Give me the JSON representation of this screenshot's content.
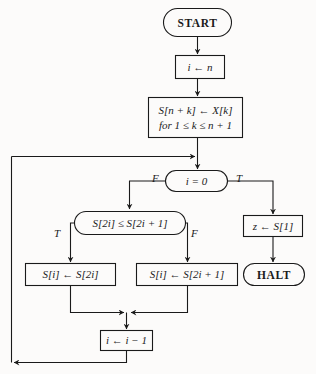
{
  "diagram": {
    "type": "flowchart",
    "stroke_color": "#1a1a1a",
    "background_color": "#fcfbfa",
    "nodes": {
      "start": {
        "label": "START",
        "shape": "terminator"
      },
      "init_i": {
        "label": "i ← n",
        "shape": "process"
      },
      "fill_array": {
        "line1": "S[n + k] ← X[k]",
        "line2": "for 1 ≤ k ≤ n + 1",
        "shape": "process"
      },
      "test_zero": {
        "label": "i = 0",
        "shape": "decision"
      },
      "compare": {
        "label": "S[2i] ≤ S[2i + 1]",
        "shape": "decision"
      },
      "assign_left": {
        "label": "S[i] ← S[2i]",
        "shape": "process"
      },
      "assign_right": {
        "label": "S[i] ← S[2i + 1]",
        "shape": "process"
      },
      "output_z": {
        "label": "z ← S[1]",
        "shape": "process"
      },
      "halt": {
        "label": "HALT",
        "shape": "terminator"
      },
      "decrement": {
        "label": "i ← i − 1",
        "shape": "process"
      }
    },
    "branch_labels": {
      "test_zero_false": "F",
      "test_zero_true": "T",
      "compare_true": "T",
      "compare_false": "F"
    }
  }
}
